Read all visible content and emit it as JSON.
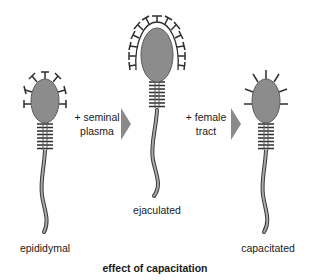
{
  "figure": {
    "title": "effect of capacitation",
    "colors": {
      "head_fill": "#8c8c8c",
      "outline": "#3a3a3a",
      "tail_fill": "#9a9a9a",
      "arrow": "#8a8a8a",
      "text": "#1a1a1a",
      "background": "#ffffff"
    },
    "stages": [
      {
        "label": "epididymal",
        "surface": "sparse T-shaped projections"
      },
      {
        "label": "ejaculated",
        "surface": "dense coat of T-shaped projections"
      },
      {
        "label": "capacitated",
        "surface": "short spikes, coat removed"
      }
    ],
    "transitions": [
      {
        "line1": "+ seminal",
        "line2": "plasma",
        "icon": "arrow-right-icon"
      },
      {
        "line1": "+ female",
        "line2": "tract",
        "icon": "arrow-right-icon"
      }
    ]
  }
}
